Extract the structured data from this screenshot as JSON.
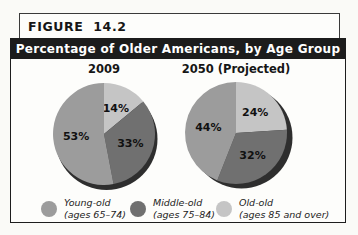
{
  "figure": {
    "label": "FIGURE 14.2",
    "title": "Percentage of Older Americans, by Age Group"
  },
  "colors": {
    "young_old": "#9c9c9c",
    "middle_old": "#707070",
    "old_old": "#c5c5c5",
    "pie_shadow": "#2e2e2e",
    "title_bar_bg": "#1c1c1c",
    "title_bar_text": "#ffffff",
    "border": "#1d1d1d"
  },
  "chart_data": [
    {
      "type": "pie",
      "title": "2009",
      "start_angle_deg": 0,
      "direction": "clockwise",
      "slices": [
        {
          "category": "Old-old (ages 85 and over)",
          "value": 14,
          "label": "14%",
          "color_key": "old_old"
        },
        {
          "category": "Middle-old (ages 75–84)",
          "value": 33,
          "label": "33%",
          "color_key": "middle_old"
        },
        {
          "category": "Young-old (ages 65–74)",
          "value": 53,
          "label": "53%",
          "color_key": "young_old"
        }
      ]
    },
    {
      "type": "pie",
      "title": "2050 (Projected)",
      "start_angle_deg": 0,
      "direction": "clockwise",
      "slices": [
        {
          "category": "Old-old (ages 85 and over)",
          "value": 24,
          "label": "24%",
          "color_key": "old_old"
        },
        {
          "category": "Middle-old (ages 75–84)",
          "value": 32,
          "label": "32%",
          "color_key": "middle_old"
        },
        {
          "category": "Young-old (ages 65–74)",
          "value": 44,
          "label": "44%",
          "color_key": "young_old"
        }
      ]
    }
  ],
  "legend": {
    "items": [
      {
        "name": "Young-old",
        "detail": "(ages 65–74)",
        "color_key": "young_old"
      },
      {
        "name": "Middle-old",
        "detail": "(ages 75–84)",
        "color_key": "middle_old"
      },
      {
        "name": "Old-old",
        "detail": "(ages 85 and over)",
        "color_key": "old_old"
      }
    ]
  }
}
